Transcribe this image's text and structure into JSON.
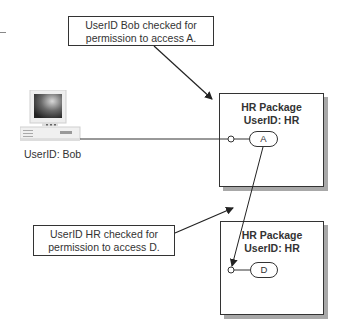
{
  "callouts": {
    "top": {
      "line1": "UserID Bob checked for",
      "line2": "permission to access A."
    },
    "bottom": {
      "line1": "UserID HR checked for",
      "line2": "permission to access D."
    }
  },
  "computer": {
    "label": "UserID: Bob",
    "icon": "desktop-computer-icon"
  },
  "packages": [
    {
      "title": "HR Package",
      "userid": "UserID: HR",
      "component": "A"
    },
    {
      "title": "HR Package",
      "userid": "UserID: HR",
      "component": "D"
    }
  ],
  "colors": {
    "line": "#333333",
    "shadow": "#a8a8a8",
    "background": "#ffffff"
  }
}
